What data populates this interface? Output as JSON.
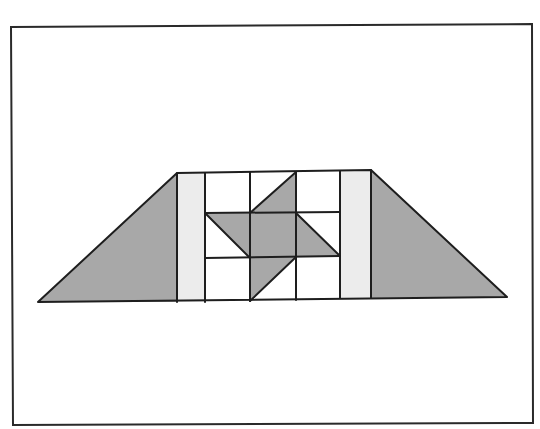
{
  "diagram": {
    "title": "",
    "type": "quilt-block",
    "colors": {
      "background": "#ffffff",
      "frame": "#2a2a2a",
      "line": "#1e1e1e",
      "dark_fill": "#a8a8a8",
      "light_fill": "#ececec",
      "white_fill": "#ffffff"
    },
    "frame": {
      "points": "11,27 532,24 533,423 13,425"
    },
    "outline": {
      "points": "38,302 177,173 371,170 507,297"
    },
    "shapes": [
      {
        "name": "left-corner-triangle",
        "fill": "dark_fill",
        "points": "38,302 177,173 177,302"
      },
      {
        "name": "right-corner-triangle",
        "fill": "dark_fill",
        "points": "371,170 507,297 371,298"
      },
      {
        "name": "left-sashing-strip",
        "fill": "light_fill",
        "points": "177,173 205,173 205,302 177,302"
      },
      {
        "name": "right-sashing-strip",
        "fill": "light_fill",
        "points": "340,171 371,170 371,298 340,298"
      },
      {
        "name": "top-pinwheel-triangle",
        "fill": "dark_fill",
        "points": "296,172 296,213 250,213"
      },
      {
        "name": "center-square",
        "fill": "dark_fill",
        "points": "250,213 296,213 296,257 250,258"
      },
      {
        "name": "left-pinwheel-parallelogram",
        "fill": "dark_fill",
        "points": "206,214 250,213 250,258 250,258"
      },
      {
        "name": "left-pinwheel-triangle",
        "fill": "dark_fill",
        "points": "206,214 250,213 250,258"
      },
      {
        "name": "right-pinwheel-triangle",
        "fill": "dark_fill",
        "points": "296,213 340,256 296,257"
      },
      {
        "name": "bottom-pinwheel-triangle",
        "fill": "dark_fill",
        "points": "250,258 296,257 250,301"
      }
    ],
    "lines": [
      {
        "name": "grid-row-top",
        "x1": 205,
        "y1": 213,
        "x2": 340,
        "y2": 212
      },
      {
        "name": "grid-row-bottom",
        "x1": 205,
        "y1": 258,
        "x2": 340,
        "y2": 256
      },
      {
        "name": "grid-col-1",
        "x1": 177,
        "y1": 173,
        "x2": 177,
        "y2": 302
      },
      {
        "name": "grid-col-2",
        "x1": 205,
        "y1": 173,
        "x2": 205,
        "y2": 302
      },
      {
        "name": "grid-col-3",
        "x1": 250,
        "y1": 172,
        "x2": 250,
        "y2": 301
      },
      {
        "name": "grid-col-4",
        "x1": 296,
        "y1": 172,
        "x2": 296,
        "y2": 300
      },
      {
        "name": "grid-col-5",
        "x1": 340,
        "y1": 171,
        "x2": 340,
        "y2": 298
      },
      {
        "name": "grid-col-6",
        "x1": 371,
        "y1": 170,
        "x2": 371,
        "y2": 298
      },
      {
        "name": "diag-top",
        "x1": 296,
        "y1": 172,
        "x2": 250,
        "y2": 213
      },
      {
        "name": "diag-left",
        "x1": 206,
        "y1": 214,
        "x2": 250,
        "y2": 258
      },
      {
        "name": "diag-right",
        "x1": 296,
        "y1": 213,
        "x2": 340,
        "y2": 256
      },
      {
        "name": "diag-bottom",
        "x1": 296,
        "y1": 257,
        "x2": 250,
        "y2": 301
      }
    ]
  }
}
